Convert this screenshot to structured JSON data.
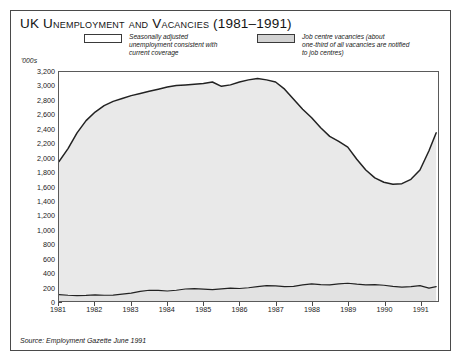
{
  "figure": {
    "title": "UK Unemployment and Vacancies (1981–1991)",
    "units_label": "'000s",
    "source": "Source: Employment Gazette June 1991"
  },
  "legend": {
    "position": "top",
    "entries": [
      {
        "key": "unemployment",
        "label": "Seasonally adjusted\nunemployment consistent with\ncurrent coverage",
        "swatch_fill": "#ffffff",
        "swatch_border": "#3a3a3a"
      },
      {
        "key": "vacancies",
        "label": "Job centre vacancies (about\none-third of all vacancies are notified\nto job centres)",
        "swatch_fill": "#d2d2d2",
        "swatch_border": "#3a3a3a"
      }
    ]
  },
  "chart_data": {
    "type": "area",
    "title": "UK Unemployment and Vacancies (1981–1991)",
    "xlabel": "",
    "ylabel": "'000s",
    "ylim": [
      0,
      3200
    ],
    "ytick_step": 200,
    "ytick_labels": [
      "3,200",
      "3,000",
      "2,800",
      "2,600",
      "2,400",
      "2,200",
      "2,000",
      "1,800",
      "1,600",
      "1,400",
      "1,200",
      "1,000",
      "800",
      "600",
      "400",
      "200",
      "0"
    ],
    "ytick_values": [
      3200,
      3000,
      2800,
      2600,
      2400,
      2200,
      2000,
      1800,
      1600,
      1400,
      1200,
      1000,
      800,
      600,
      400,
      200,
      0
    ],
    "xlim": [
      1981.0,
      1991.5
    ],
    "categories": [
      "1981",
      "1982",
      "1983",
      "1984",
      "1985",
      "1986",
      "1987",
      "1988",
      "1989",
      "1990",
      "1991"
    ],
    "xtick_values": [
      1981,
      1982,
      1983,
      1984,
      1985,
      1986,
      1987,
      1988,
      1989,
      1990,
      1991
    ],
    "grid": false,
    "legend_position": "top",
    "fill_color": "#e9e9e9",
    "line_color": "#222222",
    "series": [
      {
        "name": "Seasonally adjusted unemployment consistent with current coverage",
        "units": "'000s",
        "x": [
          1981.0,
          1981.25,
          1981.5,
          1981.75,
          1982.0,
          1982.25,
          1982.5,
          1982.75,
          1983.0,
          1983.25,
          1983.5,
          1983.75,
          1984.0,
          1984.25,
          1984.5,
          1984.75,
          1985.0,
          1985.25,
          1985.5,
          1985.75,
          1986.0,
          1986.25,
          1986.5,
          1986.75,
          1987.0,
          1987.25,
          1987.5,
          1987.75,
          1988.0,
          1988.25,
          1988.5,
          1988.75,
          1989.0,
          1989.25,
          1989.5,
          1989.75,
          1990.0,
          1990.25,
          1990.5,
          1990.75,
          1991.0,
          1991.25,
          1991.45
        ],
        "values": [
          1950,
          2130,
          2350,
          2520,
          2640,
          2730,
          2790,
          2830,
          2870,
          2900,
          2930,
          2960,
          2990,
          3010,
          3020,
          3030,
          3040,
          3060,
          3000,
          3020,
          3060,
          3090,
          3110,
          3090,
          3060,
          2960,
          2820,
          2680,
          2560,
          2420,
          2300,
          2230,
          2150,
          1980,
          1830,
          1720,
          1660,
          1630,
          1640,
          1700,
          1830,
          2100,
          2350
        ]
      },
      {
        "name": "Job centre vacancies (about one-third of all vacancies are notified to job centres)",
        "units": "'000s",
        "x": [
          1981.0,
          1981.25,
          1981.5,
          1981.75,
          1982.0,
          1982.25,
          1982.5,
          1982.75,
          1983.0,
          1983.25,
          1983.5,
          1983.75,
          1984.0,
          1984.25,
          1984.5,
          1984.75,
          1985.0,
          1985.25,
          1985.5,
          1985.75,
          1986.0,
          1986.25,
          1986.5,
          1986.75,
          1987.0,
          1987.25,
          1987.5,
          1987.75,
          1988.0,
          1988.25,
          1988.5,
          1988.75,
          1989.0,
          1989.25,
          1989.5,
          1989.75,
          1990.0,
          1990.25,
          1990.5,
          1990.75,
          1991.0,
          1991.25,
          1991.45
        ],
        "values": [
          90,
          80,
          75,
          78,
          85,
          80,
          82,
          95,
          110,
          135,
          150,
          148,
          140,
          150,
          168,
          172,
          165,
          160,
          170,
          180,
          175,
          185,
          200,
          215,
          210,
          200,
          205,
          225,
          240,
          230,
          225,
          240,
          248,
          235,
          225,
          230,
          220,
          205,
          195,
          200,
          215,
          180,
          200
        ]
      }
    ]
  }
}
